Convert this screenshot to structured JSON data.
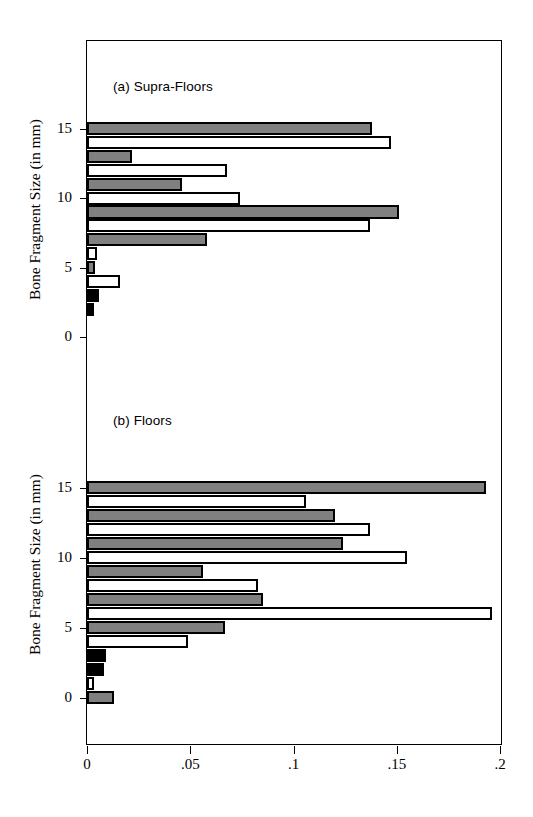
{
  "figure": {
    "y_axis_title": "Bone Fragment Size (in mm)",
    "x_ticks": [
      "0",
      ".05",
      ".1",
      ".15",
      ".2"
    ],
    "x_tick_values": [
      0,
      0.05,
      0.1,
      0.15,
      0.2
    ],
    "y_ticks": [
      "0",
      "5",
      "10",
      "15"
    ],
    "y_tick_values": [
      0,
      5,
      10,
      15
    ]
  },
  "chart_data": [
    {
      "type": "bar",
      "orientation": "horizontal",
      "title": "(a) Supra-Floors",
      "xlabel": "",
      "ylabel": "Bone Fragment Size (in mm)",
      "xlim": [
        0,
        0.2
      ],
      "ylim": [
        0,
        17
      ],
      "grid": false,
      "legend": "none",
      "categories": [
        15,
        14,
        13,
        12,
        11,
        10,
        9,
        8,
        7,
        6,
        5,
        4,
        3,
        2
      ],
      "series": [
        {
          "name": "Supra-Floors proportion",
          "values": [
            0.138,
            0.147,
            0.022,
            0.068,
            0.046,
            0.074,
            0.151,
            0.137,
            0.058,
            0.005,
            0.004,
            0.016,
            0.006,
            0.0
          ]
        }
      ],
      "bar_fills": [
        "gray",
        "white",
        "gray",
        "white",
        "gray",
        "white",
        "gray",
        "white",
        "gray",
        "white",
        "gray",
        "white",
        "black",
        "black"
      ]
    },
    {
      "type": "bar",
      "orientation": "horizontal",
      "title": "(b) Floors",
      "xlabel": "",
      "ylabel": "Bone Fragment Size (in mm)",
      "xlim": [
        0,
        0.2
      ],
      "ylim": [
        -1,
        17
      ],
      "grid": false,
      "legend": "none",
      "categories": [
        15,
        14,
        13,
        12,
        11,
        10,
        9,
        8,
        7,
        6,
        5,
        4,
        3,
        2,
        1,
        0
      ],
      "series": [
        {
          "name": "Floors proportion",
          "values": [
            0.193,
            0.106,
            0.12,
            0.137,
            0.124,
            0.155,
            0.056,
            0.083,
            0.085,
            0.196,
            0.067,
            0.049,
            0.009,
            0.008,
            0.002,
            0.013
          ]
        }
      ],
      "bar_fills": [
        "gray",
        "white",
        "gray",
        "white",
        "gray",
        "white",
        "gray",
        "white",
        "gray",
        "white",
        "gray",
        "white",
        "black",
        "black",
        "white",
        "gray"
      ]
    }
  ],
  "colors": {
    "gray": "#808080",
    "black": "#000000",
    "white": "#ffffff",
    "axis": "#000000"
  }
}
